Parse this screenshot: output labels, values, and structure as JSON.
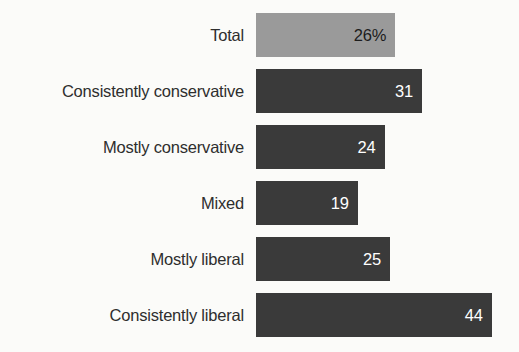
{
  "chart_data": {
    "type": "bar",
    "orientation": "horizontal",
    "title": "",
    "subtitle": "",
    "xlabel": "",
    "ylabel": "",
    "grid": false,
    "legend": false,
    "axis_visible": false,
    "xlim": [
      0,
      48
    ],
    "categories": [
      "Total",
      "Consistently conservative",
      "Mostly conservative",
      "Mixed",
      "Mostly liberal",
      "Consistently liberal"
    ],
    "values": [
      26,
      31,
      24,
      19,
      25,
      44
    ],
    "data_labels": [
      "26%",
      "31",
      "24",
      "19",
      "25",
      "44"
    ],
    "bars": [
      {
        "label": "Total",
        "value": 26,
        "data_label": "26%",
        "style": "light",
        "bar_color": "#9a9a9a",
        "value_color": "#1c1c1c"
      },
      {
        "label": "Consistently conservative",
        "value": 31,
        "data_label": "31",
        "style": "dark",
        "bar_color": "#3a3a3a",
        "value_color": "#ffffff"
      },
      {
        "label": "Mostly conservative",
        "value": 24,
        "data_label": "24",
        "style": "dark",
        "bar_color": "#3a3a3a",
        "value_color": "#ffffff"
      },
      {
        "label": "Mixed",
        "value": 19,
        "data_label": "19",
        "style": "dark",
        "bar_color": "#3a3a3a",
        "value_color": "#ffffff"
      },
      {
        "label": "Mostly liberal",
        "value": 25,
        "data_label": "25",
        "style": "dark",
        "bar_color": "#3a3a3a",
        "value_color": "#ffffff"
      },
      {
        "label": "Consistently liberal",
        "value": 44,
        "data_label": "44",
        "style": "dark",
        "bar_color": "#3a3a3a",
        "value_color": "#ffffff"
      }
    ],
    "colors": {
      "background": "#fbfbf9",
      "bar_dark": "#3a3a3a",
      "bar_light": "#9a9a9a",
      "label_text": "#2e2e2e"
    }
  }
}
